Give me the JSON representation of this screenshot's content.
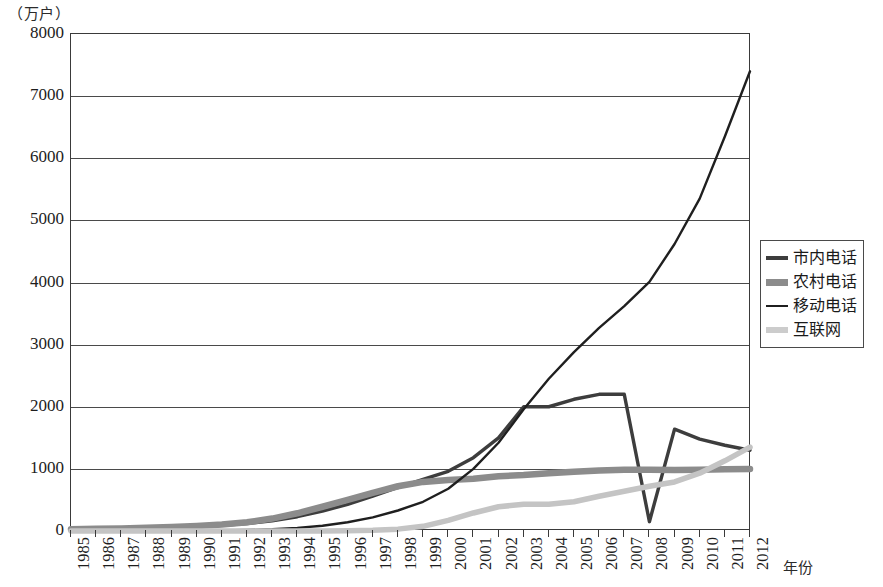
{
  "chart_data": {
    "type": "line",
    "title": "（万户）",
    "xlabel": "年份",
    "ylabel": "（万户）",
    "unit_caption": "（万户）",
    "grid": true,
    "legend_position": "right",
    "ylim": [
      0,
      8000
    ],
    "xlim": [
      1985,
      2012
    ],
    "y_ticks": [
      0,
      1000,
      2000,
      3000,
      4000,
      5000,
      6000,
      7000,
      8000
    ],
    "y_tick_labels": [
      "0",
      "1000",
      "2000",
      "3000",
      "4000",
      "5000",
      "6000",
      "7000",
      "8000"
    ],
    "categories": [
      "1985",
      "1986",
      "1987",
      "1988",
      "1989",
      "1990",
      "1991",
      "1992",
      "1993",
      "1994",
      "1995",
      "1996",
      "1997",
      "1998",
      "1999",
      "2000",
      "2001",
      "2002",
      "2003",
      "2004",
      "2005",
      "2006",
      "2007",
      "2008",
      "2009",
      "2010",
      "2011",
      "2012"
    ],
    "series": [
      {
        "name": "市内电话",
        "color": "#3d3d3d",
        "width": 3.4,
        "values": [
          20,
          25,
          32,
          40,
          52,
          68,
          90,
          120,
          165,
          230,
          320,
          430,
          560,
          700,
          830,
          960,
          1180,
          1500,
          2000,
          2000,
          2120,
          2200,
          2200,
          150,
          1640,
          1480,
          1380,
          1300
        ]
      },
      {
        "name": "农村电话",
        "color": "#8c8c8c",
        "width": 6.5,
        "values": [
          30,
          35,
          42,
          52,
          65,
          82,
          105,
          140,
          200,
          285,
          390,
          500,
          615,
          720,
          790,
          820,
          840,
          880,
          900,
          930,
          955,
          975,
          985,
          985,
          980,
          985,
          995,
          1000
        ]
      },
      {
        "name": "移动电话",
        "color": "#1f1f1f",
        "width": 2.4,
        "values": [
          0,
          0,
          0,
          1,
          2,
          4,
          8,
          15,
          28,
          50,
          85,
          140,
          220,
          330,
          470,
          680,
          1000,
          1420,
          1960,
          2450,
          2880,
          3270,
          3620,
          4010,
          4620,
          5350,
          6350,
          7400
        ]
      },
      {
        "name": "互联网",
        "color": "#c4c4c4",
        "width": 5.5,
        "values": [
          0,
          0,
          0,
          0,
          0,
          0,
          0,
          0,
          0,
          0,
          0,
          5,
          12,
          30,
          75,
          170,
          290,
          390,
          430,
          430,
          470,
          560,
          640,
          720,
          790,
          930,
          1130,
          1350
        ]
      }
    ],
    "legend": [
      {
        "label": "市内电话",
        "color": "#3d3d3d",
        "thickness": 3.4
      },
      {
        "label": "农村电话",
        "color": "#8c8c8c",
        "thickness": 7
      },
      {
        "label": "移动电话",
        "color": "#1f1f1f",
        "thickness": 2.2
      },
      {
        "label": "互联网",
        "color": "#cccccc",
        "thickness": 5.5
      }
    ]
  }
}
